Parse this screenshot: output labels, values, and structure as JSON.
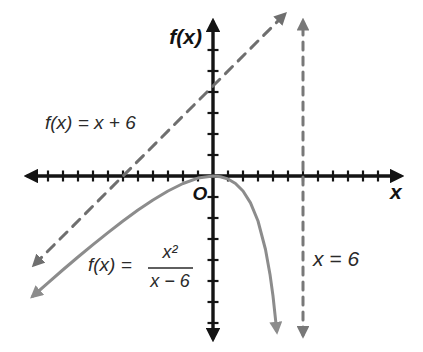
{
  "figure": {
    "y_axis_label": "f(x)",
    "x_axis_label": "x",
    "origin_label": "O",
    "labels": {
      "linear": "f(x) = x + 6",
      "rational_prefix": "f(x) =",
      "rational_numerator": "x²",
      "rational_denominator": "x − 6",
      "asymptote": "x = 6"
    },
    "colors": {
      "axis": "#141414",
      "linear_line": "#6f6f6f",
      "curve": "#8c8c8c",
      "asymptote": "#787878",
      "label_text": "#2a2a2a"
    }
  },
  "chart_data": {
    "type": "line",
    "xlabel": "x",
    "ylabel": "f(x)",
    "xlim": [
      -12.4,
      12.4
    ],
    "ylim": [
      -11,
      10.5
    ],
    "grid": false,
    "legend_position": "none",
    "origin_marker": "O",
    "series": [
      {
        "id": "linear-function-line",
        "name": "f(x) = x + 6",
        "style": "dashed",
        "arrows": "both",
        "color": "#6f6f6f",
        "dash": "10 8",
        "points": [
          [
            -11.9,
            -5.9
          ],
          [
            4.75,
            10.75
          ]
        ]
      },
      {
        "id": "rational-function-curve",
        "name": "f(x) = x²/(x−6)",
        "style": "solid",
        "arrows": "both",
        "color": "#8c8c8c",
        "dash": "",
        "points": [
          [
            -12,
            -8
          ],
          [
            -11,
            -7.12
          ],
          [
            -10,
            -6.25
          ],
          [
            -9,
            -5.4
          ],
          [
            -8,
            -4.57
          ],
          [
            -7,
            -3.77
          ],
          [
            -6,
            -3
          ],
          [
            -5,
            -2.27
          ],
          [
            -4,
            -1.6
          ],
          [
            -3,
            -1
          ],
          [
            -2,
            -0.5
          ],
          [
            -1,
            -0.14
          ],
          [
            0,
            0
          ],
          [
            0.5,
            -0.05
          ],
          [
            1,
            -0.2
          ],
          [
            1.5,
            -0.5
          ],
          [
            2,
            -1
          ],
          [
            2.5,
            -1.79
          ],
          [
            3,
            -3
          ],
          [
            3.5,
            -4.9
          ],
          [
            3.8,
            -6.56
          ],
          [
            4,
            -8
          ],
          [
            4.25,
            -10.32
          ]
        ]
      },
      {
        "id": "vertical-asymptote-line",
        "name": "x = 6",
        "style": "dashed",
        "arrows": "both",
        "color": "#787878",
        "dash": "8 7",
        "points": [
          [
            6,
            -10.6
          ],
          [
            6,
            10.3
          ]
        ]
      }
    ]
  }
}
